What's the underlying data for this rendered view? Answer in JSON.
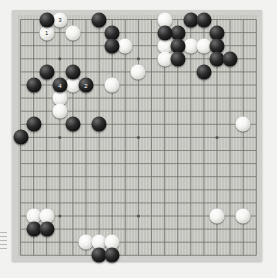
{
  "app": {
    "title": "Go Board Position",
    "board_size": 19,
    "background_color": "#c9c9c4",
    "frame_color": "#cfcfcb",
    "line_color": "#6d6d68",
    "black_color": "#111111",
    "white_color": "#f4f4f2"
  },
  "board": {
    "size": 19,
    "star_points": [
      [
        3,
        3
      ],
      [
        9,
        3
      ],
      [
        15,
        3
      ],
      [
        3,
        9
      ],
      [
        9,
        9
      ],
      [
        15,
        9
      ],
      [
        3,
        15
      ],
      [
        9,
        15
      ],
      [
        15,
        15
      ]
    ],
    "black_stones": [
      [
        3,
        1
      ],
      [
        7,
        1
      ],
      [
        13,
        2
      ],
      [
        13,
        3
      ],
      [
        13,
        4
      ],
      [
        14,
        1
      ],
      [
        15,
        1
      ],
      [
        16,
        2
      ],
      [
        16,
        3
      ],
      [
        16,
        4
      ],
      [
        15,
        5
      ],
      [
        17,
        4
      ],
      [
        12,
        2
      ],
      [
        8,
        2
      ],
      [
        8,
        3
      ],
      [
        3,
        5
      ],
      [
        5,
        5
      ],
      [
        2,
        6
      ],
      [
        4,
        6
      ],
      [
        6,
        6
      ],
      [
        2,
        9
      ],
      [
        5,
        9
      ],
      [
        7,
        9
      ],
      [
        1,
        10
      ],
      [
        2,
        17
      ],
      [
        3,
        17
      ],
      [
        7,
        19
      ],
      [
        8,
        19
      ]
    ],
    "white_stones": [
      [
        4,
        1
      ],
      [
        3,
        2
      ],
      [
        5,
        2
      ],
      [
        12,
        1
      ],
      [
        12,
        3
      ],
      [
        12,
        4
      ],
      [
        14,
        3
      ],
      [
        15,
        3
      ],
      [
        9,
        3
      ],
      [
        10,
        5
      ],
      [
        8,
        6
      ],
      [
        5,
        6
      ],
      [
        4,
        7
      ],
      [
        4,
        8
      ],
      [
        18,
        9
      ],
      [
        2,
        16
      ],
      [
        3,
        16
      ],
      [
        6,
        18
      ],
      [
        7,
        18
      ],
      [
        8,
        18
      ],
      [
        16,
        16
      ],
      [
        18,
        16
      ]
    ],
    "labeled_stones": [
      {
        "col": 4,
        "row": 1,
        "color": "white",
        "label": "3"
      },
      {
        "col": 3,
        "row": 2,
        "color": "white",
        "label": "1"
      },
      {
        "col": 4,
        "row": 6,
        "color": "black",
        "label": "4"
      },
      {
        "col": 6,
        "row": 6,
        "color": "black",
        "label": "2"
      }
    ]
  },
  "geometry": {
    "origin_x": 20.5,
    "origin_y": 19.5,
    "spacing": 13.1,
    "stone_diameter": 15
  },
  "edge_ticks": {
    "count": 5,
    "label": "edge-marks"
  }
}
